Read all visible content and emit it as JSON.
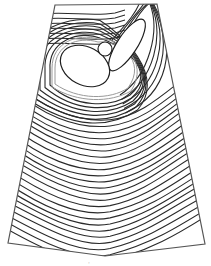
{
  "figure": {
    "type": "contour-diagram",
    "colors": {
      "background": "#ffffff",
      "contour": "#2a2a2a",
      "halo": "#9a9a9a",
      "outline": "#555555"
    },
    "outline_points": [
      [
        55,
        5
      ],
      [
        157,
        4
      ],
      [
        205,
        244
      ],
      [
        105,
        256
      ],
      [
        8,
        243
      ]
    ],
    "shapes": {
      "big_ellipse": {
        "cx": 85,
        "cy": 66,
        "rx": 26,
        "ry": 19,
        "rotate": 28
      },
      "small_circle": {
        "cx": 105,
        "cy": 49,
        "r": 7
      },
      "lobe": {
        "cx": 127,
        "cy": 45,
        "rx": 30,
        "ry": 10,
        "rotate": -57
      }
    },
    "contour_count_lower": 24,
    "bottom_mark": "·"
  }
}
